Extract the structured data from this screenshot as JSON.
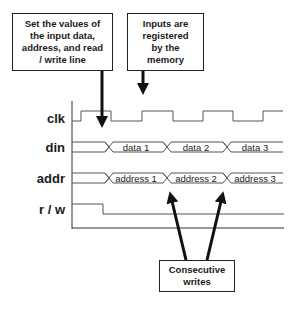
{
  "callouts": {
    "set_values": "Set the values of\nthe input data,\naddress, and read\n/ write line",
    "registered": "Inputs are\nregistered\nby the\nmemory",
    "consecutive": "Consecutive\nwrites"
  },
  "signals": {
    "clk": "clk",
    "din": "din",
    "addr": "addr",
    "rw": "r / w"
  },
  "din_values": [
    "data 1",
    "data 2",
    "data 3"
  ],
  "addr_values": [
    "address 1",
    "address 2",
    "address 3"
  ],
  "colors": {
    "line": "#222222",
    "wave": "#555555"
  }
}
